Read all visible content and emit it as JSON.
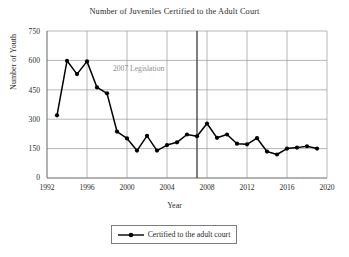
{
  "chart_data": {
    "type": "line",
    "title": "Number of Juveniles Certified to the Adult Court",
    "xlabel": "Year",
    "ylabel": "Number of Youth",
    "xlim": [
      1992,
      2020
    ],
    "ylim": [
      0,
      750
    ],
    "xticks": [
      "1992",
      "1996",
      "2000",
      "2004",
      "2008",
      "2012",
      "2016",
      "2020"
    ],
    "yticks": [
      "0",
      "150",
      "300",
      "450",
      "600",
      "750"
    ],
    "grid": true,
    "legend_position": "below-plot",
    "series": [
      {
        "name": "Certified to the adult court",
        "color": "#000000",
        "marker": "filled-circle",
        "x": [
          1993,
          1994,
          1995,
          1996,
          1997,
          1998,
          1999,
          2000,
          2001,
          2002,
          2003,
          2004,
          2005,
          2006,
          2007,
          2008,
          2009,
          2010,
          2011,
          2012,
          2013,
          2014,
          2015,
          2016,
          2017,
          2018,
          2019
        ],
        "values": [
          320,
          598,
          530,
          595,
          462,
          432,
          237,
          202,
          140,
          215,
          140,
          168,
          182,
          222,
          213,
          278,
          205,
          222,
          175,
          172,
          203,
          135,
          120,
          150,
          155,
          162,
          150
        ]
      }
    ],
    "annotations": [
      {
        "name": "legislation-marker",
        "text": "2007 Legislation",
        "x": 2007,
        "type": "vertical-line",
        "color": "#3a3a3a"
      }
    ]
  },
  "legend": {
    "entries": [
      {
        "label": "Certified to the adult court"
      }
    ]
  }
}
